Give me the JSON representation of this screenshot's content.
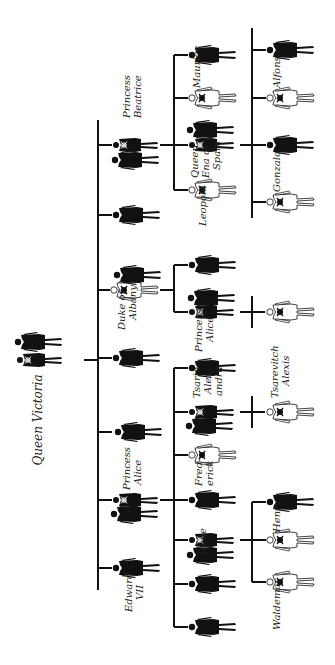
{
  "diagram": {
    "title": "Queen Victoria",
    "type": "pedigree",
    "orientation": "rotated-90-ccw",
    "legend": {
      "black_figure": "unaffected",
      "white_figure_with_skull": "hemophiliac male",
      "figure_with_small_skull": "carrier female"
    },
    "colors": {
      "ink": "#111111",
      "background": "#ffffff"
    },
    "labels": {
      "queen_victoria": "Queen Victoria",
      "edward_vii": [
        "Edward",
        "VII"
      ],
      "princess_alice_gen2": [
        "Princess",
        "Alice"
      ],
      "duke_of_albany": [
        "Duke of",
        "Albany"
      ],
      "princess_beatrice": [
        "Princess",
        "Beatrice"
      ],
      "irene": "Irene",
      "frederick": [
        "Fred-",
        "erick"
      ],
      "tsarina_alexandra": [
        "Tsarina",
        "Alex-",
        "andra"
      ],
      "princess_alice_gen3": [
        "Princess",
        "Alice"
      ],
      "leopold": "Leopold",
      "queen_ena": [
        "Queen",
        "Ena of",
        "Spain"
      ],
      "maurice": "Maurice",
      "waldemar": "Waldemar",
      "henry": "Henry",
      "tsarevitch_alexis": [
        "Tsarevitch",
        "Alexis"
      ],
      "gonzalo": "Gonzalo",
      "alfonso": "Alfonso"
    },
    "generations": [
      {
        "gen": 1,
        "members": [
          {
            "name": "Queen Victoria",
            "status": "carrier",
            "with_spouse": true
          }
        ]
      },
      {
        "gen": 2,
        "members": [
          {
            "name": "Edward VII",
            "status": "unaffected"
          },
          {
            "name": "",
            "status": "unaffected"
          },
          {
            "name": "Princess Alice",
            "status": "carrier",
            "with_spouse": true
          },
          {
            "name": "",
            "status": "unaffected"
          },
          {
            "name": "",
            "status": "unaffected"
          },
          {
            "name": "Duke of Albany",
            "status": "hemophiliac",
            "with_spouse": true
          },
          {
            "name": "",
            "status": "unaffected"
          },
          {
            "name": "Princess Beatrice",
            "status": "carrier",
            "with_spouse": true
          }
        ]
      },
      {
        "gen": 3,
        "members": [
          {
            "name": "",
            "status": "unaffected"
          },
          {
            "name": "",
            "status": "unaffected"
          },
          {
            "name": "Irene",
            "status": "carrier",
            "with_spouse": true
          },
          {
            "name": "",
            "status": "unaffected"
          },
          {
            "name": "Frederick",
            "status": "hemophiliac"
          },
          {
            "name": "Tsarina Alexandra",
            "status": "carrier",
            "with_spouse": true
          },
          {
            "name": "",
            "status": "unaffected"
          },
          {
            "name": "",
            "status": "unaffected"
          },
          {
            "name": "Princess Alice",
            "status": "carrier",
            "with_spouse": true
          },
          {
            "name": "Leopold",
            "status": "hemophiliac"
          },
          {
            "name": "Queen Ena of Spain",
            "status": "carrier",
            "with_spouse": true
          },
          {
            "name": "Maurice",
            "status": "hemophiliac"
          },
          {
            "name": "",
            "status": "unaffected"
          }
        ]
      },
      {
        "gen": 4,
        "members": [
          {
            "name": "Waldemar",
            "status": "hemophiliac"
          },
          {
            "name": "Henry",
            "status": "hemophiliac"
          },
          {
            "name": "",
            "status": "unaffected"
          },
          {
            "name": "Tsarevitch Alexis",
            "status": "hemophiliac"
          },
          {
            "name": "",
            "status": "hemophiliac"
          },
          {
            "name": "Gonzalo",
            "status": "hemophiliac"
          },
          {
            "name": "",
            "status": "unaffected"
          },
          {
            "name": "Alfonso",
            "status": "hemophiliac"
          },
          {
            "name": "",
            "status": "unaffected"
          }
        ]
      }
    ]
  }
}
